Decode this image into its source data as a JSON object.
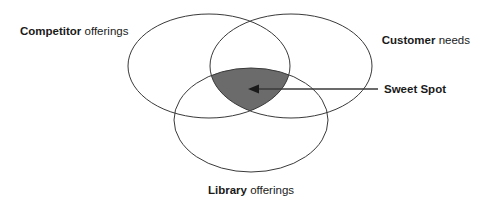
{
  "diagram": {
    "type": "venn-3-set",
    "background_color": "#ffffff",
    "stroke_color": "#3a3a3a",
    "stroke_width": 1,
    "text_color": "#1a1a1a",
    "highlight_fill": "#6b6b6b",
    "arrow_color": "#3a3a3a",
    "sets": [
      {
        "id": "competitor",
        "label_strong": "Competitor",
        "label_plain": " offerings",
        "position": "top-left",
        "cx": 209,
        "cy": 66,
        "rx": 81,
        "ry": 52
      },
      {
        "id": "customer",
        "label_strong": "Customer",
        "label_plain": " needs",
        "position": "top-right",
        "cx": 291,
        "cy": 66,
        "rx": 81,
        "ry": 52
      },
      {
        "id": "library",
        "label_strong": "Library",
        "label_plain": " offerings",
        "position": "bottom-center",
        "cx": 251,
        "cy": 120,
        "rx": 77,
        "ry": 52
      }
    ],
    "intersection": {
      "id": "sweet-spot",
      "label_strong": "Sweet Spot",
      "label_plain": "",
      "fill": "#6b6b6b",
      "callout": {
        "from_x": 378,
        "from_y": 89,
        "to_x": 248,
        "to_y": 89
      }
    }
  }
}
